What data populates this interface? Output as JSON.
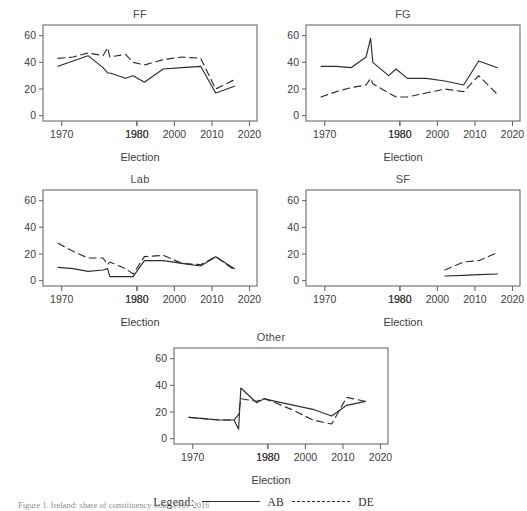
{
  "figure": {
    "caption": "Figure 1. Ireland: share of constituency vote, 1969-2016",
    "axis_title": "Election",
    "legend": {
      "label": "Legend:",
      "solid_name": "AB",
      "dashed_name": "DE"
    }
  },
  "chart_data": {
    "type": "line",
    "xlabel": "Election",
    "ylabel": "",
    "xlim": [
      1965,
      2022
    ],
    "ylim": [
      -4,
      68
    ],
    "xticks": [
      1970,
      1980,
      1980,
      2000,
      2010,
      2020
    ],
    "xtick_values": [
      1970,
      1990,
      1990,
      2000,
      2010,
      2020
    ],
    "yticks": [
      0,
      20,
      40,
      60
    ],
    "grid": false,
    "legend_position": "bottom-center",
    "legend_entries": [
      "AB",
      "DE"
    ],
    "panels": [
      {
        "name": "FF",
        "title": "FF",
        "series": [
          {
            "name": "AB",
            "style": "solid",
            "x": [
              1969,
              1973,
              1977,
              1981,
              1982.2,
              1982.8,
              1987,
              1989,
              1992,
              1997,
              2002,
              2007,
              2011,
              2016
            ],
            "values": [
              37,
              41,
              45,
              36,
              32,
              32,
              28,
              30,
              25,
              35,
              36,
              37,
              17,
              22
            ]
          },
          {
            "name": "DE",
            "style": "dashed",
            "x": [
              1969,
              1973,
              1977,
              1981,
              1982.2,
              1982.8,
              1987,
              1989,
              1992,
              1997,
              2002,
              2007,
              2011,
              2016
            ],
            "values": [
              43,
              44,
              47,
              45,
              51,
              44,
              46,
              40,
              38,
              42,
              44,
              43,
              20,
              27
            ]
          }
        ]
      },
      {
        "name": "FG",
        "title": "FG",
        "series": [
          {
            "name": "AB",
            "style": "solid",
            "x": [
              1969,
              1973,
              1977,
              1981,
              1982.2,
              1982.8,
              1987,
              1989,
              1992,
              1997,
              2002,
              2007,
              2011,
              2016
            ],
            "values": [
              37,
              37,
              36,
              44,
              58,
              40,
              30,
              35,
              28,
              28,
              26,
              23,
              41,
              36
            ]
          },
          {
            "name": "DE",
            "style": "dashed",
            "x": [
              1969,
              1973,
              1977,
              1981,
              1982.2,
              1982.8,
              1987,
              1989,
              1992,
              1997,
              2002,
              2007,
              2011,
              2016
            ],
            "values": [
              14,
              18,
              21,
              23,
              28,
              24,
              17,
              14,
              14,
              17,
              20,
              18,
              30,
              16
            ]
          }
        ]
      },
      {
        "name": "Lab",
        "title": "Lab",
        "series": [
          {
            "name": "AB",
            "style": "solid",
            "x": [
              1969,
              1973,
              1977,
              1981,
              1982.2,
              1982.8,
              1987,
              1989,
              1992,
              1997,
              2002,
              2007,
              2011,
              2016
            ],
            "values": [
              10,
              9,
              7,
              8,
              9,
              3,
              3,
              3,
              15,
              15,
              13,
              11,
              18,
              9
            ]
          },
          {
            "name": "DE",
            "style": "dashed",
            "x": [
              1969,
              1973,
              1977,
              1981,
              1982.2,
              1982.8,
              1987,
              1989,
              1992,
              1997,
              2002,
              2007,
              2011,
              2016
            ],
            "values": [
              28,
              22,
              17,
              17,
              12,
              14,
              9,
              5,
              18,
              19,
              13,
              12,
              18,
              8
            ]
          }
        ]
      },
      {
        "name": "SF",
        "title": "SF",
        "series": [
          {
            "name": "AB",
            "style": "solid",
            "x": [
              2002,
              2007,
              2011,
              2016
            ],
            "values": [
              3.5,
              4,
              4.5,
              5
            ]
          },
          {
            "name": "DE",
            "style": "dashed",
            "x": [
              2002,
              2007,
              2011,
              2016
            ],
            "values": [
              8,
              14,
              15,
              21
            ]
          }
        ]
      },
      {
        "name": "Other",
        "title": "Other",
        "series": [
          {
            "name": "AB",
            "style": "solid",
            "x": [
              1969,
              1973,
              1977,
              1981,
              1982.2,
              1982.8,
              1987,
              1989,
              1992,
              1997,
              2002,
              2007,
              2011,
              2016
            ],
            "values": [
              16,
              15,
              14,
              14,
              7,
              38,
              27,
              30,
              28,
              25,
              22,
              17,
              25,
              28
            ]
          },
          {
            "name": "DE",
            "style": "dashed",
            "x": [
              1969,
              1973,
              1977,
              1981,
              1982.2,
              1982.8,
              1987,
              1989,
              1992,
              1997,
              2002,
              2007,
              2011,
              2016
            ],
            "values": [
              16,
              15,
              14,
              14,
              18,
              30,
              28,
              30,
              27,
              21,
              14,
              11,
              31,
              28
            ]
          }
        ]
      }
    ]
  },
  "panel_layout": [
    {
      "key": "ff",
      "left": 15,
      "top": 8,
      "width": 250,
      "height": 165
    },
    {
      "key": "fg",
      "left": 278,
      "top": 8,
      "width": 250,
      "height": 165
    },
    {
      "key": "lab",
      "left": 15,
      "top": 173,
      "width": 250,
      "height": 165
    },
    {
      "key": "sf",
      "left": 278,
      "top": 173,
      "width": 250,
      "height": 165
    },
    {
      "key": "other",
      "left": 146,
      "top": 331,
      "width": 250,
      "height": 165
    }
  ]
}
